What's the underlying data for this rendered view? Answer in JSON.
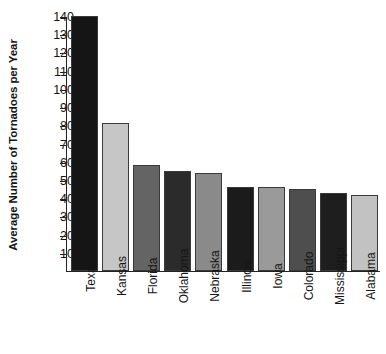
{
  "chart_data": {
    "type": "bar",
    "title": "",
    "xlabel": "",
    "ylabel": "Average Number of Tornadoes per Year",
    "ylim": [
      0,
      140
    ],
    "ytick_step": 10,
    "ytick_labels": [
      "140",
      "130",
      "120",
      "110",
      "100",
      "90",
      "80",
      "70",
      "60",
      "50",
      "40",
      "30",
      "20",
      "10"
    ],
    "grid": false,
    "legend": false,
    "categories": [
      "Texas",
      "Kansas",
      "Florida",
      "Oklahoma",
      "Nebraska",
      "Illinois",
      "Iowa",
      "Colorado",
      "Mississippi",
      "Alabama"
    ],
    "values": [
      140,
      81,
      58,
      55,
      54,
      46,
      46,
      45,
      43,
      42
    ],
    "bar_colors": [
      "#151515",
      "#c6c6c6",
      "#646464",
      "#2b2b2b",
      "#8a8a8a",
      "#1b1b1b",
      "#9a9a9a",
      "#4e4e4e",
      "#1e1e1e",
      "#c2c2c2"
    ],
    "bar_border_color": "#3a3a3a",
    "axis_color": "#222222",
    "background_color": "#ffffff"
  }
}
